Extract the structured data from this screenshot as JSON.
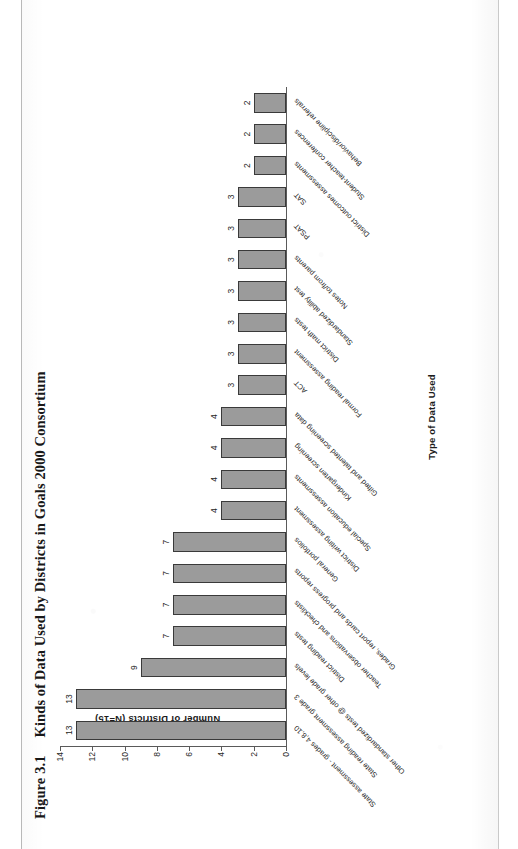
{
  "figure": {
    "number": "Figure 3.1",
    "title": "Kinds of Data Used by Districts in Goals 2000 Consortium"
  },
  "chart_data": {
    "type": "bar",
    "title": "Kinds of Data Used by Districts in Goals 2000 Consortium",
    "xlabel": "Type of Data Used",
    "ylabel": "Number of Districts (N=15)",
    "ylim": [
      0,
      14
    ],
    "yticks": [
      0,
      2,
      4,
      6,
      8,
      10,
      12,
      14
    ],
    "grid": false,
    "legend": null,
    "orientation": "vertical",
    "categories": [
      "State assessment - grades 4,8,10",
      "State reading assessment grade 3",
      "Other standardized tests @ other grade levels",
      "District reading tests",
      "Teacher observations and checklists",
      "Grades, report cards and progress reports",
      "General portfolios",
      "District writing assessment",
      "Special education assessments",
      "Kindergarten screening",
      "Gifted and talented screening data",
      "ACT",
      "Formal reading assessment",
      "District math tests",
      "Standardized ability test",
      "Notes to/from parents",
      "PSAT",
      "SAT",
      "District outcomes assessments",
      "Student-teacher conferences",
      "Behavior/discipline referrals"
    ],
    "values": [
      13,
      13,
      9,
      7,
      7,
      7,
      7,
      4,
      4,
      4,
      4,
      3,
      3,
      3,
      3,
      3,
      3,
      3,
      2,
      2,
      2
    ],
    "value_labels": [
      "13",
      "13",
      "9",
      "7",
      "7",
      "7",
      "7",
      "4",
      "4",
      "4",
      "4",
      "3",
      "3",
      "3",
      "3",
      "3",
      "3",
      "3",
      "2",
      "2",
      "2"
    ]
  },
  "colors": {
    "bar_fill": "#9b9b9b",
    "bar_border": "#3a3a3a",
    "axis": "#5a5a5a",
    "text": "#1f1f1f",
    "page_background": "#ffffff"
  }
}
